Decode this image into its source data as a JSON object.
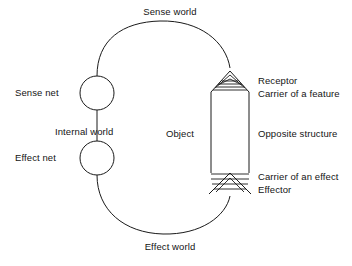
{
  "diagram": {
    "stroke_color": "#1a1a1a",
    "text_color": "#141414",
    "background_color": "#ffffff",
    "labels": {
      "sense_world": "Sense world",
      "effect_world": "Effect world",
      "sense_net": "Sense net",
      "effect_net": "Effect net",
      "internal_world": "Internal world",
      "object": "Object",
      "receptor": "Receptor",
      "carrier_of_a_feature": "Carrier of a feature",
      "opposite_structure": "Opposite structure",
      "carrier_of_an_effect": "Carrier of an effect",
      "effector": "Effector"
    },
    "nodes": [
      {
        "name": "sense-net-circle",
        "cx": 97,
        "cy": 93,
        "r": 17
      },
      {
        "name": "effect-net-circle",
        "cx": 97,
        "cy": 158,
        "r": 17
      }
    ],
    "object_body": {
      "x": 211,
      "y": 92,
      "width": 38,
      "height": 81
    }
  }
}
